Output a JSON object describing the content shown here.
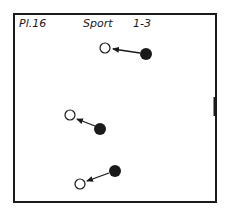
{
  "header": {
    "plate": "Pl.16",
    "title": "Sport",
    "variant": "1-3"
  },
  "colors": {
    "ink": "#1a1a1a",
    "paper": "#ffffff"
  },
  "diagram": {
    "frame": {
      "x": 14,
      "y": 14,
      "w": 201,
      "h": 187
    },
    "goal_marker": {
      "x": 215,
      "y1": 97,
      "y2": 116
    },
    "moves": [
      {
        "from": {
          "x": 146,
          "y": 54,
          "type": "filled"
        },
        "to": {
          "x": 105,
          "y": 48,
          "type": "open"
        },
        "arrow_tip": {
          "x": 113,
          "y": 49
        }
      },
      {
        "from": {
          "x": 100,
          "y": 129,
          "type": "filled"
        },
        "to": {
          "x": 70,
          "y": 115,
          "type": "open"
        },
        "arrow_tip": {
          "x": 77,
          "y": 119
        }
      },
      {
        "from": {
          "x": 115,
          "y": 171,
          "type": "filled"
        },
        "to": {
          "x": 80,
          "y": 184,
          "type": "open"
        },
        "arrow_tip": {
          "x": 87,
          "y": 181
        }
      }
    ]
  }
}
